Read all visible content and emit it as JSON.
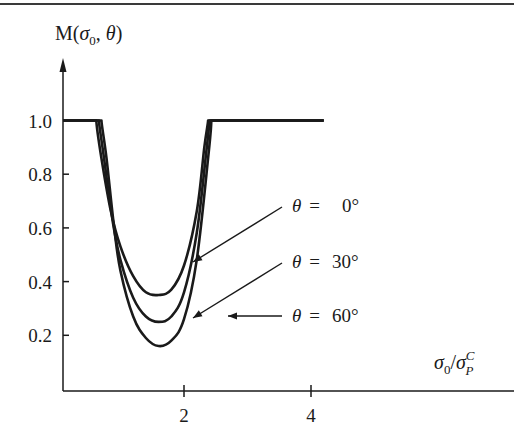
{
  "chart_data": {
    "type": "line",
    "title": "",
    "ylabel": "M(σ0, θ)",
    "xlabel": "σ0/σP^C",
    "xlim": [
      0,
      4.3
    ],
    "ylim": [
      0,
      1.1
    ],
    "x_ticks": [
      2,
      4
    ],
    "y_ticks": [
      0.2,
      0.4,
      0.6,
      0.8,
      1.0
    ],
    "x_tick_labels": [
      "2",
      "4"
    ],
    "y_tick_labels": [
      "0.2",
      "0.4",
      "0.6",
      "0.8",
      "1.0"
    ],
    "grid": false,
    "legend_position": "inline annotations with leader lines, right side",
    "series": [
      {
        "name": "θ = 0°",
        "x": [
          0.0,
          0.62,
          0.7,
          0.85,
          1.0,
          1.2,
          1.4,
          1.6,
          1.8,
          2.0,
          2.2,
          2.32,
          2.38,
          4.2
        ],
        "y": [
          1.0,
          1.0,
          0.86,
          0.66,
          0.53,
          0.42,
          0.36,
          0.35,
          0.37,
          0.46,
          0.66,
          0.9,
          1.0,
          1.0
        ]
      },
      {
        "name": "θ = 30°",
        "x": [
          0.0,
          0.66,
          0.74,
          0.88,
          1.0,
          1.2,
          1.4,
          1.6,
          1.8,
          2.0,
          2.2,
          2.35,
          2.4,
          4.2
        ],
        "y": [
          1.0,
          1.0,
          0.86,
          0.62,
          0.48,
          0.34,
          0.27,
          0.25,
          0.27,
          0.36,
          0.58,
          0.88,
          1.0,
          1.0
        ]
      },
      {
        "name": "θ = 60°",
        "x": [
          0.0,
          0.7,
          0.78,
          0.9,
          1.0,
          1.2,
          1.4,
          1.6,
          1.8,
          2.0,
          2.2,
          2.38,
          2.43,
          4.2
        ],
        "y": [
          1.0,
          1.0,
          0.86,
          0.6,
          0.44,
          0.27,
          0.19,
          0.16,
          0.18,
          0.26,
          0.48,
          0.86,
          1.0,
          1.0
        ]
      }
    ],
    "annotations": [
      {
        "text_var": "θ",
        "text_eq": "=",
        "text_val": "0°",
        "points_to": "θ = 0° curve"
      },
      {
        "text_var": "θ",
        "text_eq": "=",
        "text_val": "30°",
        "points_to": "θ = 30° curve"
      },
      {
        "text_var": "θ",
        "text_eq": "=",
        "text_val": "60°",
        "points_to": "θ = 60° curve"
      }
    ]
  },
  "labels": {
    "y_axis_M": "M(",
    "y_axis_sigma": "σ",
    "y_axis_sub0": "0",
    "y_axis_comma": ", ",
    "y_axis_theta": "θ",
    "y_axis_close": ")",
    "x_axis_sigma": "σ",
    "x_axis_sub0": "0",
    "x_axis_slash": "/",
    "x_axis_sigma2": "σ",
    "x_axis_supC": "C",
    "x_axis_subP": "P"
  }
}
